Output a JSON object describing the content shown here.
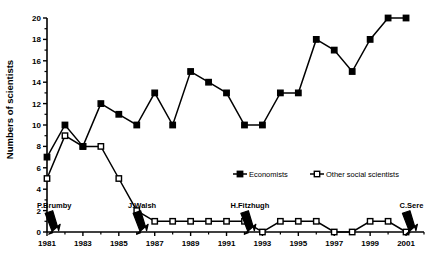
{
  "chart_data": {
    "type": "line",
    "title": "",
    "xlabel": "",
    "ylabel": "Numbers of scientists",
    "ylim": [
      0,
      20
    ],
    "ytick_step": 2,
    "yticks": [
      0,
      2,
      4,
      6,
      8,
      10,
      12,
      14,
      16,
      18,
      20
    ],
    "xlim": [
      1981,
      2002
    ],
    "xticks_major": [
      1981,
      1983,
      1985,
      1987,
      1989,
      1991,
      1993,
      1995,
      1997,
      1999,
      2001
    ],
    "xticks_minor": [
      1982,
      1984,
      1986,
      1988,
      1990,
      1992,
      1994,
      1996,
      1998,
      2000,
      2002
    ],
    "grid": false,
    "legend_position": "inside-right-middle",
    "x": [
      1981,
      1982,
      1983,
      1984,
      1985,
      1986,
      1987,
      1988,
      1989,
      1990,
      1991,
      1992,
      1993,
      1994,
      1995,
      1996,
      1997,
      1998,
      1999,
      2000,
      2001
    ],
    "series": [
      {
        "name": "Economists",
        "marker": "filled-square",
        "color": "#000000",
        "values": [
          7,
          10,
          8,
          12,
          11,
          10,
          13,
          10,
          15,
          14,
          13,
          10,
          10,
          13,
          13,
          18,
          17,
          15,
          18,
          20,
          20
        ]
      },
      {
        "name": "Other social scientists",
        "marker": "open-square",
        "color": "#000000",
        "values": [
          5,
          9,
          8,
          8,
          5,
          2,
          1,
          1,
          1,
          1,
          1,
          1,
          0,
          1,
          1,
          1,
          0,
          0,
          1,
          1,
          0
        ]
      }
    ],
    "annotations": [
      {
        "label": "P.Brumby",
        "x": 1981.4,
        "y": 1.1
      },
      {
        "label": "J.Walsh",
        "x": 1986.3,
        "y": 1.1
      },
      {
        "label": "H.Fitzhugh",
        "x": 1992.3,
        "y": 1.1
      },
      {
        "label": "C.Sere",
        "x": 2001.3,
        "y": 1.1
      }
    ]
  },
  "axis": {
    "y_title": "Numbers of scientists",
    "y_tick_labels": [
      "0",
      "2",
      "4",
      "6",
      "8",
      "10",
      "12",
      "14",
      "16",
      "18",
      "20"
    ],
    "x_tick_labels": [
      "1981",
      "1983",
      "1985",
      "1987",
      "1989",
      "1991",
      "1993",
      "1995",
      "1997",
      "1999",
      "2001"
    ]
  },
  "legend": {
    "items": [
      {
        "label": "Economists",
        "marker": "filled-square"
      },
      {
        "label": "Other social scientists",
        "marker": "open-square"
      }
    ]
  },
  "annotations": {
    "items": [
      {
        "label": "P.Brumby"
      },
      {
        "label": "J.Walsh"
      },
      {
        "label": "H.Fitzhugh"
      },
      {
        "label": "C.Sere"
      }
    ]
  }
}
